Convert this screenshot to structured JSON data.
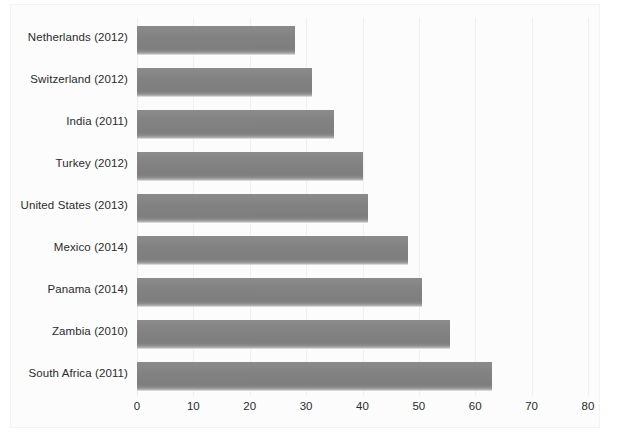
{
  "chart_data": {
    "type": "bar",
    "orientation": "horizontal",
    "title": "",
    "subtitle": "",
    "xlabel": "",
    "ylabel": "",
    "xlim": [
      0,
      80
    ],
    "xticks": [
      0,
      10,
      20,
      30,
      40,
      50,
      60,
      70,
      80
    ],
    "grid": true,
    "legend": false,
    "legend_position": "none",
    "bar_color": "#828282",
    "background_color": "#fcfcfc",
    "text_color": "#2b2b2b",
    "categories": [
      "Netherlands (2012)",
      "Switzerland (2012)",
      "India (2011)",
      "Turkey (2012)",
      "United States (2013)",
      "Mexico (2014)",
      "Panama (2014)",
      "Zambia (2010)",
      "South Africa (2011)"
    ],
    "values": [
      28,
      31,
      35,
      40,
      41,
      48,
      50.5,
      55.5,
      63
    ]
  }
}
